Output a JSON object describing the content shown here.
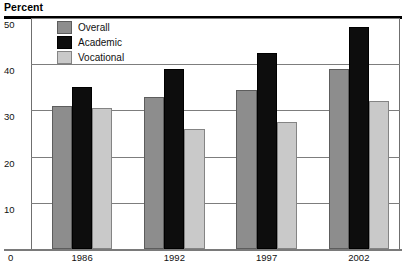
{
  "header": {
    "axis_title": "Percent"
  },
  "chart_data": {
    "type": "bar",
    "title": "Percent",
    "xlabel": "",
    "ylabel": "Percent",
    "ylim": [
      0,
      50
    ],
    "yticks": [
      0,
      10,
      20,
      30,
      40,
      50
    ],
    "ytick_labels": [
      "0",
      "10",
      "20",
      "30",
      "40",
      "50"
    ],
    "grid": true,
    "legend_position": "top-left",
    "categories": [
      "1986",
      "1992",
      "1997",
      "2002"
    ],
    "series": [
      {
        "name": "Overall",
        "color": "#8d8d8d",
        "values": [
          31,
          33,
          34.5,
          39
        ]
      },
      {
        "name": "Academic",
        "color": "#0d0d0d",
        "values": [
          35,
          39,
          42.5,
          48
        ]
      },
      {
        "name": "Vocational",
        "color": "#c9c9c9",
        "values": [
          30.5,
          26,
          27.5,
          32
        ]
      }
    ]
  }
}
